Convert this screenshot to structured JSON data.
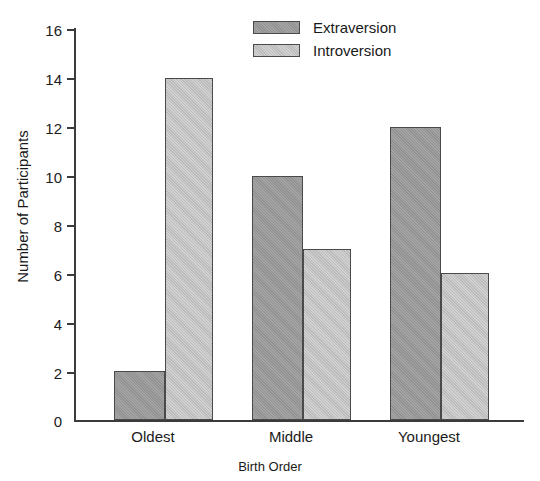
{
  "chart_data": {
    "type": "bar",
    "title": "",
    "subtitle": "",
    "xlabel": "Birth Order",
    "ylabel": "Number of Participants",
    "categories": [
      "Oldest",
      "Middle",
      "Youngest"
    ],
    "series": [
      {
        "name": "Extraversion",
        "values": [
          2,
          10,
          12
        ],
        "color": "#999a99"
      },
      {
        "name": "Introversion",
        "values": [
          14,
          7,
          6
        ],
        "color": "#c4c5c4"
      }
    ],
    "ylim": [
      0,
      16
    ],
    "ytick_labels": [
      "16",
      "14",
      "12",
      "10",
      "8",
      "6",
      "4",
      "2",
      "0"
    ],
    "ytick_values": [
      16,
      14,
      12,
      10,
      8,
      6,
      4,
      2,
      0
    ],
    "ytick_step": 2,
    "grid": false,
    "legend_position": "top-center-right",
    "bar_grouping": "grouped",
    "axis_color": "#3b3b3b",
    "background_color": "#ffffff"
  },
  "legend": {
    "entries": [
      {
        "label": "Extraversion",
        "swatch": "extraversion-swatch"
      },
      {
        "label": "Introversion",
        "swatch": "introversion-swatch"
      }
    ]
  }
}
